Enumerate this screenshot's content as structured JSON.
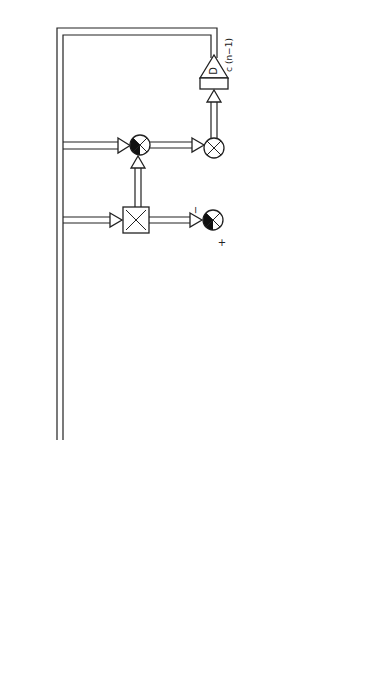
{
  "diagram": {
    "orientation": "rotated-90-ccw",
    "signals": {
      "input_x": "x [n]",
      "input_psi": "ψ [n−1]",
      "observation_y": "y [n]",
      "output": "cᵀ [n−1] φ (x [n])",
      "ct_feedback": "cᵀ [n−1]",
      "delay_output": "c (n−1)"
    },
    "blocks": {
      "phi": "φ ( x )",
      "b_psi": "B ( ψ )",
      "gamma": "Γᵢ [n]",
      "delay": "D",
      "weight_1": "ω₁₁ (t) − ω₂₂ (t)",
      "weight_2": "ω₂₁ (t) − ω₂₂ (t)",
      "step_1_high": "1",
      "step_1_zero": "0",
      "step_2_high": "1",
      "step_2_zero": "0"
    },
    "signs": {
      "minus": "−",
      "plus": "+"
    }
  }
}
